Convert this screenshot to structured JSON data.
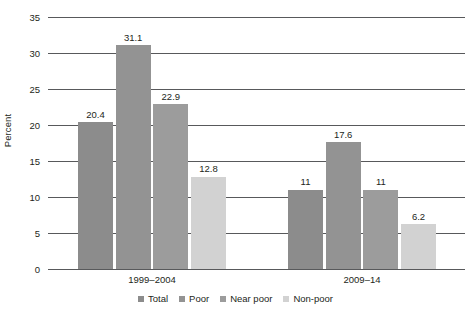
{
  "chart_data": {
    "type": "bar",
    "title": "",
    "xlabel": "",
    "ylabel": "Percent",
    "ylim": [
      0,
      35
    ],
    "yticks": [
      0,
      5,
      10,
      15,
      20,
      25,
      30,
      35
    ],
    "ytick_labels": [
      "0",
      "5",
      "10",
      "15",
      "20",
      "25",
      "30",
      "35"
    ],
    "grid": true,
    "legend_position": "bottom",
    "categories": [
      "1999–2004",
      "2009–14"
    ],
    "series": [
      {
        "name": "Total",
        "color": "#8c8c8c",
        "values": [
          20.4,
          11
        ],
        "labels": [
          "20.4",
          "11"
        ]
      },
      {
        "name": "Poor",
        "color": "#939393",
        "values": [
          31.1,
          17.6
        ],
        "labels": [
          "31.1",
          "17.6"
        ]
      },
      {
        "name": "Near poor",
        "color": "#9c9c9c",
        "values": [
          22.9,
          11
        ],
        "labels": [
          "22.9",
          "11"
        ]
      },
      {
        "name": "Non-poor",
        "color": "#d2d2d2",
        "values": [
          12.8,
          6.2
        ],
        "labels": [
          "12.8",
          "6.2"
        ]
      }
    ]
  },
  "axis": {
    "y_title": "Percent",
    "tick_0": "0",
    "tick_1": "5",
    "tick_2": "10",
    "tick_3": "15",
    "tick_4": "20",
    "tick_5": "25",
    "tick_6": "30",
    "tick_7": "35"
  },
  "groups": {
    "g0_label": "1999–2004",
    "g1_label": "2009–14"
  },
  "legend": {
    "items": [
      {
        "label": "Total"
      },
      {
        "label": "Poor"
      },
      {
        "label": "Near poor"
      },
      {
        "label": "Non-poor"
      }
    ]
  },
  "bars": {
    "g0": [
      {
        "series": "Total",
        "value_label": "20.4"
      },
      {
        "series": "Poor",
        "value_label": "31.1"
      },
      {
        "series": "Near poor",
        "value_label": "22.9"
      },
      {
        "series": "Non-poor",
        "value_label": "12.8"
      }
    ],
    "g1": [
      {
        "series": "Total",
        "value_label": "11"
      },
      {
        "series": "Poor",
        "value_label": "17.6"
      },
      {
        "series": "Near poor",
        "value_label": "11"
      },
      {
        "series": "Non-poor",
        "value_label": "6.2"
      }
    ]
  }
}
